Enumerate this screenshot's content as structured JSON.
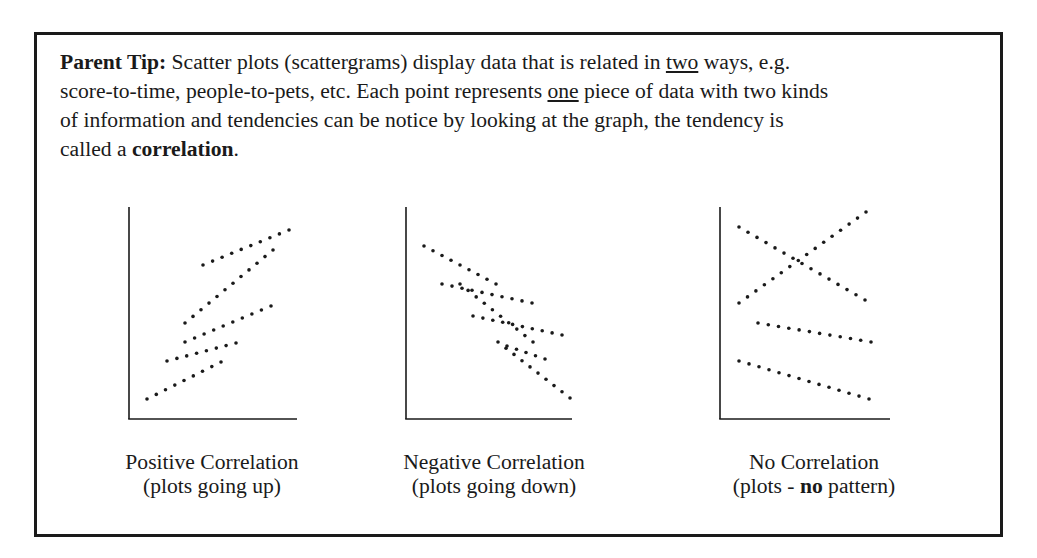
{
  "tip": {
    "label": "Parent Tip:",
    "line1_a": " Scatter plots (scattergrams) display data that is related in ",
    "line1_u": "two",
    "line1_b": " ways, e.g.",
    "line2_a": "score-to-time, people-to-pets, etc. Each point represents ",
    "line2_u": "one",
    "line2_b": " piece of data with two kinds",
    "line3": "of information and tendencies can be notice by looking at the graph, the tendency is",
    "line4_a": "called a ",
    "line4_bold": "correlation",
    "line4_b": "."
  },
  "captions": [
    {
      "title": "Positive Correlation",
      "sub": "(plots going up)"
    },
    {
      "title": "Negative Correlation",
      "sub": "(plots going down)"
    },
    {
      "title": "No Correlation",
      "sub_a": "(plots - ",
      "sub_bold": "no",
      "sub_b": " pattern)"
    }
  ],
  "colors": {
    "ink": "#1a1a1a",
    "background": "#ffffff"
  },
  "chart_data": [
    {
      "type": "scatter",
      "title": "Positive Correlation",
      "subtitle": "(plots going up)",
      "xlabel": "",
      "ylabel": "",
      "grid": false,
      "axes": {
        "origin": [
          129,
          419
        ],
        "y_top": 207,
        "x_right": 297
      },
      "series": [
        {
          "name": "line-a",
          "from": [
            203,
            265
          ],
          "to": [
            289,
            230
          ],
          "count": 10
        },
        {
          "name": "line-b",
          "from": [
            185,
            323
          ],
          "to": [
            273,
            250
          ],
          "count": 12
        },
        {
          "name": "line-c",
          "from": [
            185,
            342
          ],
          "to": [
            271,
            306
          ],
          "count": 10
        },
        {
          "name": "line-d",
          "from": [
            167,
            361
          ],
          "to": [
            236,
            343
          ],
          "count": 8
        },
        {
          "name": "line-e",
          "from": [
            147,
            399
          ],
          "to": [
            221,
            362
          ],
          "count": 9
        }
      ]
    },
    {
      "type": "scatter",
      "title": "Negative Correlation",
      "subtitle": "(plots going down)",
      "xlabel": "",
      "ylabel": "",
      "grid": false,
      "axes": {
        "origin": [
          406,
          419
        ],
        "y_top": 207,
        "x_right": 572
      },
      "series": [
        {
          "name": "line-1",
          "from": [
            424,
            246
          ],
          "to": [
            496,
            284
          ],
          "count": 9
        },
        {
          "name": "line-2",
          "from": [
            442,
            284
          ],
          "to": [
            532,
            303
          ],
          "count": 10
        },
        {
          "name": "line-3",
          "from": [
            460,
            284
          ],
          "to": [
            533,
            342
          ],
          "count": 10
        },
        {
          "name": "line-4",
          "from": [
            473,
            316
          ],
          "to": [
            562,
            335
          ],
          "count": 10
        },
        {
          "name": "line-5",
          "from": [
            498,
            342
          ],
          "to": [
            570,
            398
          ],
          "count": 10
        },
        {
          "name": "line-6",
          "from": [
            507,
            346
          ],
          "to": [
            545,
            359
          ],
          "count": 5
        }
      ]
    },
    {
      "type": "scatter",
      "title": "No Correlation",
      "subtitle": "(plots - no pattern)",
      "xlabel": "",
      "ylabel": "",
      "grid": false,
      "axes": {
        "origin": [
          720,
          419
        ],
        "y_top": 207,
        "x_right": 890
      },
      "series": [
        {
          "name": "line-up",
          "from": [
            739,
            303
          ],
          "to": [
            866,
            212
          ],
          "count": 16
        },
        {
          "name": "line-down",
          "from": [
            739,
            227
          ],
          "to": [
            865,
            300
          ],
          "count": 15
        },
        {
          "name": "line-mid",
          "from": [
            758,
            323
          ],
          "to": [
            871,
            342
          ],
          "count": 12
        },
        {
          "name": "line-low",
          "from": [
            739,
            361
          ],
          "to": [
            869,
            399
          ],
          "count": 14
        }
      ]
    }
  ]
}
